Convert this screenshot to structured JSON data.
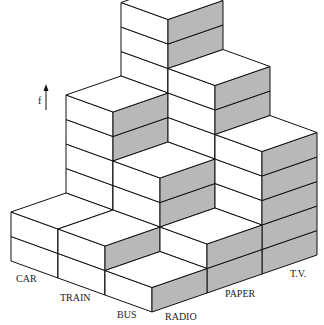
{
  "chart_data": {
    "type": "bar3d",
    "title": "",
    "ylabel": "f",
    "x_axis": {
      "name": "transport",
      "categories": [
        "CAR",
        "TRAIN",
        "BUS"
      ]
    },
    "z_axis": {
      "name": "media",
      "categories": [
        "RADIO",
        "PAPER",
        "T.V."
      ]
    },
    "values": [
      [
        2,
        6,
        9
      ],
      [
        2,
        4,
        7
      ],
      [
        1,
        2,
        5
      ]
    ],
    "grid": false,
    "legend": "none"
  },
  "colors": {
    "front_face": "#ffffff",
    "side_face": "#b8b8b8",
    "top_face": "#ffffff",
    "edge": "#111111"
  },
  "axis_label": "f"
}
